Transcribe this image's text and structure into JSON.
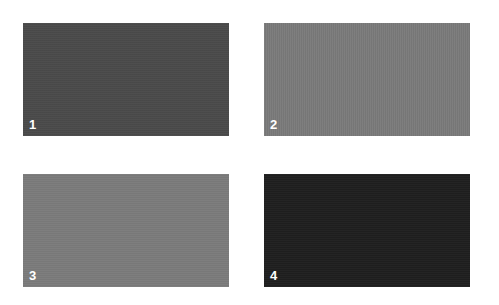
{
  "swatches": [
    {
      "label": "1",
      "color": "#4a4a4a"
    },
    {
      "label": "2",
      "color": "#7a7a7a"
    },
    {
      "label": "3",
      "color": "#7b7b7b"
    },
    {
      "label": "4",
      "color": "#1f1f1f"
    }
  ]
}
